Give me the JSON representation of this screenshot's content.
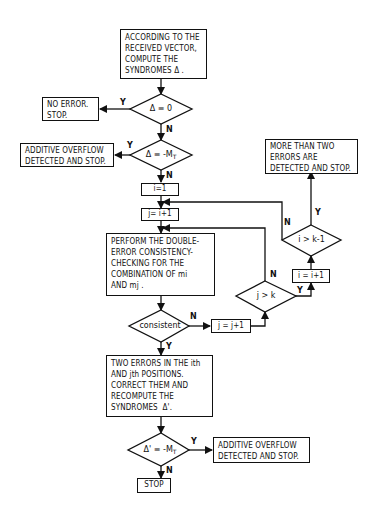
{
  "flowchart": {
    "start_box": "ACCORDING TO THE\nRECEIVED VECTOR,\nCOMPUTE THE\nSYNDROMES Δ .",
    "decision_zero": "Δ ≡ 0",
    "no_error_box": "NO ERROR.\nSTOP.",
    "decision_overflow": "Δ ≡ -M",
    "decision_overflow_sub": "T",
    "overflow_box_1": "ADDITIVE OVERFLOW\nDETECTED AND STOP.",
    "init_i": "i=1",
    "init_j": "j= i+1",
    "check_box": "PERFORM THE DOUBLE-\nERROR CONSISTENCY-\nCHECKING FOR THE\nCOMBINATION OF mi\nAND mj .",
    "decision_consistent": "consistent",
    "inc_j": "j = j+1",
    "decision_j_gt_k": "j > k",
    "inc_i": "i = i+1",
    "decision_i_gt_k1": "i > k-1",
    "more_errors_box": "MORE THAN TWO\nERRORS ARE\nDETECTED AND STOP.",
    "correct_box": "TWO ERRORS IN THE ith\nAND jth POSITIONS.\nCORRECT THEM AND\nRECOMPUTE THE\nSYNDROMES  Δ'.",
    "decision_recheck": "Δ' ≡ -M",
    "decision_recheck_sub": "T",
    "overflow_box_2": "ADDITIVE OVERFLOW\nDETECTED AND STOP.",
    "stop_box": "STOP",
    "labels": {
      "yes": "Y",
      "no": "N"
    }
  }
}
